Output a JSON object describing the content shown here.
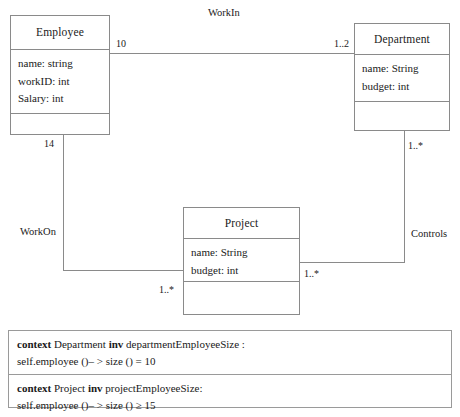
{
  "diagram": {
    "type": "uml-class-diagram",
    "classes": [
      {
        "id": "employee",
        "name": "Employee",
        "attributes": [
          "name: string",
          "workID: int",
          "Salary: int"
        ],
        "operations": []
      },
      {
        "id": "department",
        "name": "Department",
        "attributes": [
          "name: String",
          "budget: int"
        ],
        "operations": []
      },
      {
        "id": "project",
        "name": "Project",
        "attributes": [
          "name: String",
          "budget: int"
        ],
        "operations": []
      }
    ],
    "associations": [
      {
        "id": "workin",
        "label": "WorkIn",
        "source": "Employee",
        "target": "Department",
        "source_multiplicity": "10",
        "target_multiplicity": "1..2"
      },
      {
        "id": "workon",
        "label": "WorkOn",
        "source": "Employee",
        "target": "Project",
        "source_multiplicity": "14",
        "target_multiplicity": "1..*"
      },
      {
        "id": "controls",
        "label": "Controls",
        "source": "Department",
        "target": "Project",
        "source_multiplicity": "1..*",
        "target_multiplicity": "1..*"
      }
    ]
  },
  "ocl": {
    "constraints": [
      {
        "context_keyword": "context",
        "context_type": "Department",
        "inv_keyword": "inv",
        "invariant_name": "departmentEmployeeSize :",
        "expression": "self.employee ()– > size () = 10"
      },
      {
        "context_keyword": "context",
        "context_type": "Project",
        "inv_keyword": "inv",
        "invariant_name": "projectEmployeeSize:",
        "expression": "self.employee ()– > size () ≥ 15"
      }
    ]
  },
  "colors": {
    "line": "#8a8a8a",
    "text": "#1a1a1a",
    "background": "#ffffff",
    "ocl_border": "#9a9a9a"
  }
}
